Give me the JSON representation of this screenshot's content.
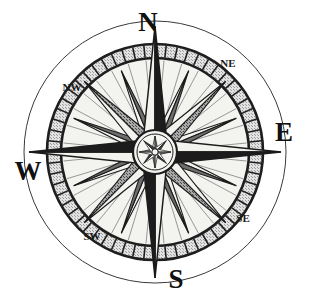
{
  "figure": {
    "background_color": "#ffffff",
    "width": 310,
    "height": 306
  },
  "compass": {
    "center": {
      "x": 155,
      "y": 152
    },
    "outer_circle_radius": 131,
    "ring_outer_radius": 108,
    "ring_inner_radius": 94,
    "ring_tick_count": 60,
    "hub_radius": 21,
    "hub_inner_radius": 12,
    "star_point_count": 16,
    "cardinal_point_length": 126,
    "intercardinal_point_length": 100,
    "minor_point_length": 88,
    "secondary_point_length": 62
  },
  "colors": {
    "ink": "#1a1a1a",
    "outline": "#222222",
    "ring_fill": "#c9c9c9",
    "ring_band": "#efefef",
    "point_light": "#f2f2ee",
    "point_dark": "#1c1c1c",
    "point_mid": "#6e6e6e",
    "point_shade": "#8c8c8c",
    "face_fill": "#f4f4f1",
    "background": "#ffffff"
  },
  "labels": {
    "cardinal": [
      {
        "name": "north",
        "text": "N",
        "x": 148,
        "y": 31,
        "anchor": "middle"
      },
      {
        "name": "east",
        "text": "E",
        "x": 284,
        "y": 141,
        "anchor": "middle"
      },
      {
        "name": "south",
        "text": "S",
        "x": 176,
        "y": 288,
        "anchor": "middle"
      },
      {
        "name": "west",
        "text": "W",
        "x": 28,
        "y": 180,
        "anchor": "middle"
      }
    ],
    "intercardinal": [
      {
        "name": "northeast",
        "text": "NE",
        "x": 228,
        "y": 67,
        "anchor": "middle"
      },
      {
        "name": "northwest",
        "text": "NW",
        "x": 72,
        "y": 91,
        "anchor": "middle"
      },
      {
        "name": "southeast",
        "text": "SE",
        "x": 243,
        "y": 222,
        "anchor": "middle"
      },
      {
        "name": "southwest",
        "text": "SW",
        "x": 92,
        "y": 240,
        "anchor": "middle"
      }
    ]
  },
  "icons": {
    "compass_rose": "compass-rose-icon",
    "outer_ring": "graduated-ring-icon",
    "center_hub": "center-hub-rose-icon"
  }
}
